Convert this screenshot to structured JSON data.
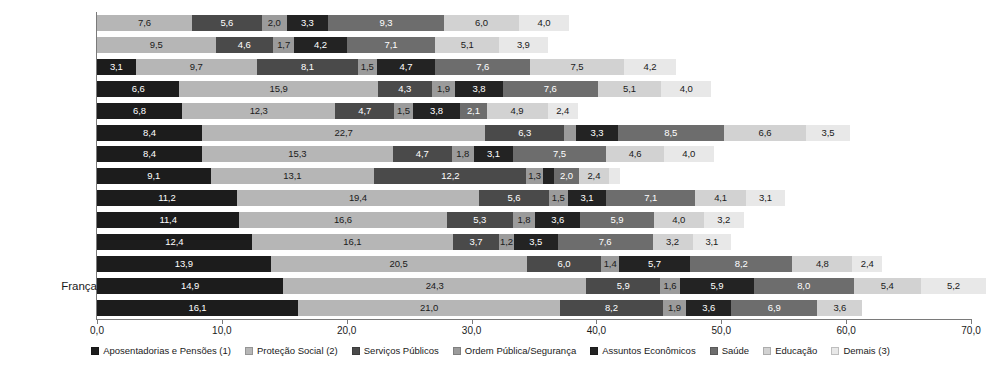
{
  "chart_data": {
    "type": "bar",
    "subtype": "stacked-horizontal-bar",
    "title": "",
    "xlabel": "",
    "ylabel": "",
    "xlim": [
      0.0,
      70.0
    ],
    "xticks": [
      "0,0",
      "10,0",
      "20,0",
      "30,0",
      "40,0",
      "50,0",
      "60,0",
      "70,0"
    ],
    "xtick_values": [
      0,
      10,
      20,
      30,
      40,
      50,
      60,
      70
    ],
    "grid": false,
    "legend_position": "bottom",
    "decimal_separator": ",",
    "categories": [
      "Estados Unidos",
      "Austrália",
      "Islândia",
      "Holanda",
      "Suíça",
      "Dinamarca",
      "Reino Unido",
      "Brasil",
      "Alemanha",
      "Espanha",
      "Japão",
      "Áustria",
      "França",
      "Itália"
    ],
    "highlight_category": "Brasil",
    "series": [
      {
        "name": "Aposentadorias e Pensões (1)",
        "color": "#1c1c1c",
        "values": [
          0.0,
          0.0,
          3.1,
          6.6,
          6.8,
          8.4,
          8.4,
          9.1,
          11.2,
          11.4,
          12.4,
          13.9,
          14.9,
          16.1
        ],
        "labels": [
          "",
          "",
          "3,1",
          "6,6",
          "6,8",
          "8,4",
          "8,4",
          "9,1",
          "11,2",
          "11,4",
          "12,4",
          "13,9",
          "14,9",
          "16,1"
        ]
      },
      {
        "name": "Proteção Social (2)",
        "color": "#b6b6b6",
        "values": [
          7.6,
          9.5,
          9.7,
          15.9,
          12.3,
          22.7,
          15.3,
          13.1,
          19.4,
          16.6,
          16.1,
          20.5,
          24.3,
          21.0
        ],
        "labels": [
          "7,6",
          "9,5",
          "9,7",
          "15,9",
          "12,3",
          "22,7",
          "15,3",
          "13,1",
          "19,4",
          "16,6",
          "16,1",
          "20,5",
          "24,3",
          "21,0"
        ]
      },
      {
        "name": "Serviços Públicos",
        "color": "#4a4a4a",
        "values": [
          5.6,
          4.6,
          8.1,
          4.3,
          4.7,
          6.3,
          4.7,
          12.2,
          5.6,
          5.3,
          3.7,
          6.0,
          5.9,
          8.2
        ],
        "labels": [
          "5,6",
          "4,6",
          "8,1",
          "4,3",
          "4,7",
          "6,3",
          "4,7",
          "12,2",
          "5,6",
          "5,3",
          "3,7",
          "6,0",
          "5,9",
          "8,2"
        ]
      },
      {
        "name": "Ordem Pública/Segurança",
        "color": "#9b9b9b",
        "values": [
          2.0,
          1.7,
          1.5,
          1.9,
          1.5,
          1.0,
          1.8,
          1.3,
          1.5,
          1.8,
          1.2,
          1.4,
          1.6,
          1.9
        ],
        "labels": [
          "2,0",
          "1,7",
          "1,5",
          "1,9",
          "1,5",
          "1,0",
          "1,8",
          "1,3",
          "1,5",
          "1,8",
          "1,2",
          "1,4",
          "1,6",
          "1,9"
        ]
      },
      {
        "name": "Assuntos Econômicos",
        "color": "#232323",
        "values": [
          3.3,
          4.2,
          4.7,
          3.8,
          3.8,
          3.3,
          3.1,
          0.9,
          3.1,
          3.6,
          3.5,
          5.7,
          5.9,
          3.6
        ],
        "labels": [
          "3,3",
          "4,2",
          "4,7",
          "3,8",
          "3,8",
          "3,3",
          "3,1",
          "0,9",
          "3,1",
          "3,6",
          "3,5",
          "5,7",
          "5,9",
          "3,6"
        ]
      },
      {
        "name": "Saúde",
        "color": "#6d6d6d",
        "values": [
          9.3,
          7.1,
          7.6,
          7.6,
          2.1,
          8.5,
          7.5,
          2.0,
          7.1,
          5.9,
          7.6,
          8.2,
          8.0,
          6.9
        ],
        "labels": [
          "9,3",
          "7,1",
          "7,6",
          "7,6",
          "2,1",
          "8,5",
          "7,5",
          "2,0",
          "7,1",
          "5,9",
          "7,6",
          "8,2",
          "8,0",
          "6,9"
        ]
      },
      {
        "name": "Educação",
        "color": "#d2d2d2",
        "values": [
          6.0,
          5.1,
          7.5,
          5.1,
          4.9,
          6.6,
          4.6,
          2.4,
          4.1,
          4.0,
          3.2,
          4.8,
          5.4,
          3.6
        ],
        "labels": [
          "6,0",
          "5,1",
          "7,5",
          "5,1",
          "4,9",
          "6,6",
          "4,6",
          "2,4",
          "4,1",
          "4,0",
          "3,2",
          "4,8",
          "5,4",
          "3,6"
        ]
      },
      {
        "name": "Demais (3)",
        "color": "#e8e8e8",
        "values": [
          4.0,
          3.9,
          4.2,
          4.0,
          2.4,
          3.5,
          4.0,
          0.9,
          3.1,
          3.2,
          3.1,
          2.4,
          5.2,
          0.0
        ],
        "labels": [
          "4,0",
          "3,9",
          "4,2",
          "4,0",
          "2,4",
          "3,5",
          "4,0",
          "0,9",
          "3,1",
          "3,2",
          "3,1",
          "2,4",
          "5,2",
          ""
        ]
      }
    ]
  }
}
